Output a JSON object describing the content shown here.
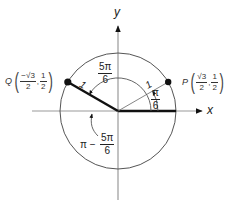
{
  "diagram": {
    "type": "unit-circle",
    "axes": {
      "x_label": "x",
      "y_label": "y"
    },
    "center": [
      118,
      111
    ],
    "radius": 58,
    "points": {
      "P": {
        "name": "P",
        "x_num": "√3",
        "x_den": "2",
        "y_num": "1",
        "y_den": "2",
        "angle": "π/6"
      },
      "Q": {
        "name": "Q",
        "x_num": "−√3",
        "x_den": "2",
        "y_num": "1",
        "y_den": "2",
        "angle": "5π/6"
      }
    },
    "radius_labels": {
      "P": "1",
      "Q": "1"
    },
    "angle_labels": {
      "five_pi_six": {
        "num": "5π",
        "den": "6"
      },
      "pi_six": {
        "num": "π",
        "den": "6"
      },
      "reference": {
        "prefix": "π −",
        "num": "5π",
        "den": "6"
      }
    },
    "colors": {
      "axis": "#999999",
      "circle": "#555555",
      "bold": "#111111",
      "thin_radius": "#777777"
    }
  }
}
